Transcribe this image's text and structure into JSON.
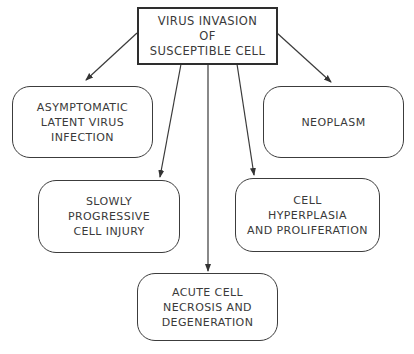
{
  "diagram": {
    "type": "flowchart",
    "root": {
      "id": "virus-invasion",
      "lines": [
        "VIRUS INVASION",
        "OF",
        "SUSCEPTIBLE CELL"
      ]
    },
    "outcomes": [
      {
        "id": "asymptomatic",
        "lines": [
          "ASYMPTOMATIC",
          "LATENT VIRUS",
          "INFECTION"
        ]
      },
      {
        "id": "neoplasm",
        "lines": [
          "NEOPLASM"
        ]
      },
      {
        "id": "slowly-progressive",
        "lines": [
          "SLOWLY",
          "PROGRESSIVE",
          "CELL INJURY"
        ]
      },
      {
        "id": "hyperplasia",
        "lines": [
          "CELL",
          "HYPERPLASIA",
          "AND PROLIFERATION"
        ]
      },
      {
        "id": "acute-necrosis",
        "lines": [
          "ACUTE CELL",
          "NECROSIS AND",
          "DEGENERATION"
        ]
      }
    ],
    "edges": [
      {
        "from": "virus-invasion",
        "to": "asymptomatic"
      },
      {
        "from": "virus-invasion",
        "to": "neoplasm"
      },
      {
        "from": "virus-invasion",
        "to": "slowly-progressive"
      },
      {
        "from": "virus-invasion",
        "to": "acute-necrosis"
      },
      {
        "from": "virus-invasion",
        "to": "hyperplasia"
      }
    ],
    "colors": {
      "line": "#3a3a3a",
      "background": "#ffffff",
      "text": "#3a3a3a"
    }
  }
}
